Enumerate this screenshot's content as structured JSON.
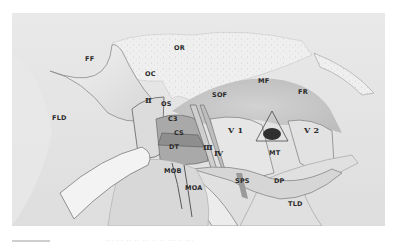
{
  "figure": {
    "labels": {
      "FF": "FF",
      "OR": "OR",
      "OC": "OC",
      "FLD": "FLD",
      "II": "Ⅱ",
      "OS": "OS",
      "C3": "C3",
      "CS": "CS",
      "DT": "DT",
      "III": "Ⅲ",
      "IV": "Ⅳ",
      "SOF": "SOF",
      "MF": "MF",
      "FR": "FR",
      "V1": "V 1",
      "V2": "V 2",
      "MT": "MT",
      "MOB": "MOB",
      "MOA": "MOA",
      "SPS": "SPS",
      "DP": "DP",
      "TLD": "TLD"
    }
  },
  "caption": {
    "text": "··· ··· ·· ·· ··· ·· ·· ··· ·· ···"
  },
  "colors": {
    "background": "#e4e4e4",
    "bone": "#f0f0f0",
    "shadow": "#8a8a8a",
    "label": "#2a2a2a"
  }
}
